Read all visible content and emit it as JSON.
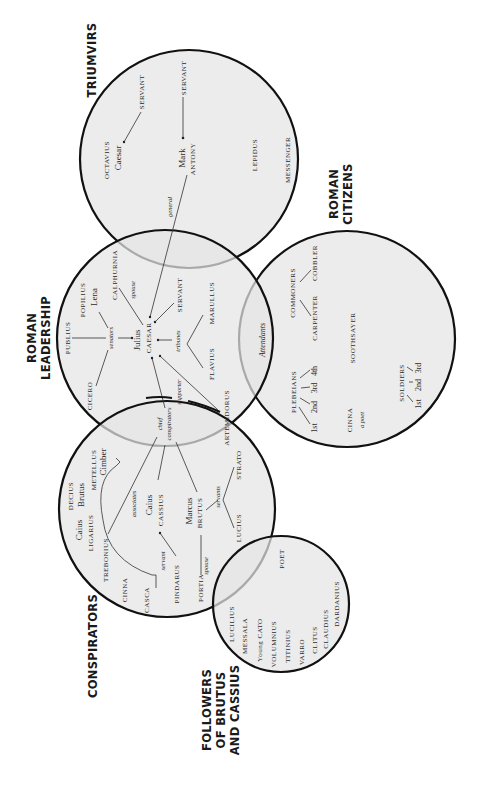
{
  "diagram": {
    "groups": [
      {
        "id": "triumvirs",
        "title": [
          "TRIUMVIRS"
        ],
        "cx": 189,
        "cy": 159,
        "r": 109,
        "title_x": 92,
        "title_y": 60
      },
      {
        "id": "roman-leadership",
        "title": [
          "ROMAN",
          "LEADERSHIP"
        ],
        "cx": 165,
        "cy": 338,
        "r": 108,
        "title_x": 36,
        "title_y": 338
      },
      {
        "id": "roman-citizens",
        "title": [
          "ROMAN",
          "CITIZENS"
        ],
        "cx": 347,
        "cy": 339,
        "r": 108,
        "title_x": 338,
        "title_y": 194
      },
      {
        "id": "conspirators",
        "title": [
          "CONSPIRATORS"
        ],
        "cx": 167,
        "cy": 509,
        "r": 108,
        "title_x": 93,
        "title_y": 646
      },
      {
        "id": "followers",
        "title": [
          "FOLLOWERS",
          "OF BRUTUS",
          "AND CASSIUS"
        ],
        "cx": 281,
        "cy": 604,
        "r": 68,
        "title_x": 211,
        "title_y": 710
      }
    ],
    "labels": {
      "triumvirs": {
        "octavius": "OCTAVIUS",
        "octavius_given": "Caesar",
        "servant_octavius": "SERVANT",
        "mark": "Mark",
        "antony": "ANTONY",
        "servant_antony": "SERVANT",
        "lepidus": "LEPIDUS",
        "messenger": "MESSENGER",
        "general": "general"
      },
      "leadership": {
        "publius": "PUBLIUS",
        "popilius": "POPILIUS",
        "popilius_given": "Lena",
        "senators": "senators",
        "calphurnia": "CALPHURNIA",
        "spouse": "spouse",
        "julius": "Julius",
        "caesar": "CAESAR",
        "tribunes": "tribunes",
        "servant": "SERVANT",
        "marullus": "MARULLUS",
        "flavius": "FLAVIUS",
        "cicero": "CICERO",
        "supporter": "supporter",
        "artemidorus": "ARTEMIDORUS",
        "attendants": "Attendants"
      },
      "citizens": {
        "commoners": "COMMONERS",
        "carpenter": "CARPENTER",
        "cobbler": "COBBLER",
        "soothsayer": "SOOTHSAYER",
        "plebeians": "PLEBEIANS",
        "pleb_1": "1st",
        "pleb_2": "2nd",
        "pleb_3": "3rd",
        "pleb_4": "4th",
        "soldiers": "SOLDIERS",
        "sold_1": "1st",
        "sold_2": "2nd",
        "sold_3": "3rd",
        "cinna": "CINNA",
        "cinna_desc": "a poet"
      },
      "conspirators": {
        "chief": "chief",
        "conspirators": "conspirators",
        "decius": "DECIUS",
        "decius_given": "Brutus",
        "metellus": "METELLUS",
        "metellus_given": "Cimber",
        "caius_lig": "Caius",
        "ligarius": "LIGARIUS",
        "trebonius": "TREBONIUS",
        "cinna": "CINNA",
        "casca": "CASCA",
        "associates": "associates",
        "caius_cas": "Caius",
        "cassius": "CASSIUS",
        "servant": "servant",
        "pindarus": "PINDARUS",
        "marcus": "Marcus",
        "brutus": "BRUTUS",
        "servants": "servants",
        "strato": "STRATO",
        "lucius": "LUCIUS",
        "portia": "PORTIA",
        "spouse": "spouse"
      },
      "followers": {
        "poet": "POET",
        "lucilius": "LUCILIUS",
        "messala": "MESSALA",
        "young_cato": "Young CATO",
        "volumnius": "VOLUMNIUS",
        "titinius": "TITINIUS",
        "varro": "VARRO",
        "clitus": "CLITUS",
        "claudius": "CLAUDIUS",
        "dardanius": "DARDANIUS"
      }
    }
  }
}
